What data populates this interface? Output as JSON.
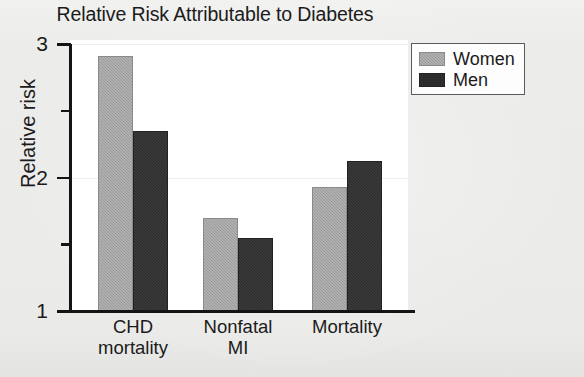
{
  "chart_data": {
    "type": "bar",
    "title": "Relative Risk Attributable to Diabetes",
    "xlabel": "",
    "ylabel": "Relative risk",
    "categories": [
      "CHD mortality",
      "Nonfatal MI",
      "Mortality"
    ],
    "category_lines": [
      [
        "CHD",
        "mortality"
      ],
      [
        "Nonfatal",
        "MI"
      ],
      [
        "Mortality"
      ]
    ],
    "series": [
      {
        "name": "Women",
        "color": "#9a9a9a",
        "values": [
          2.91,
          1.7,
          1.93
        ]
      },
      {
        "name": "Men",
        "color": "#2b2b2b",
        "values": [
          2.35,
          1.55,
          2.12
        ]
      }
    ],
    "ylim": [
      1,
      3
    ],
    "y_major_ticks": [
      1,
      2,
      3
    ],
    "y_major_tick_labels": [
      "1",
      "2",
      "3"
    ],
    "y_minor_ticks": [
      1.5,
      2.5
    ],
    "grid": true,
    "grid_axis": "y",
    "legend_position": "top-right",
    "background_color": "#ececeb",
    "plot_background_color": "#ffffff",
    "axis_color": "#141414"
  }
}
